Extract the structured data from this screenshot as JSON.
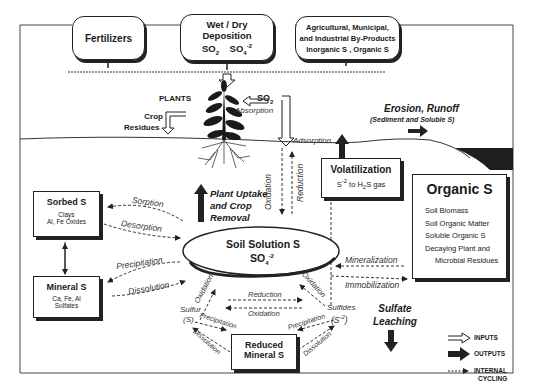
{
  "inputs": {
    "fertilizers": "Fertilizers",
    "deposition": {
      "title": "Wet / Dry Deposition",
      "species_1": "SO",
      "species_1_sub": "2",
      "species_2": "SO",
      "species_2_sub": "4",
      "species_2_sup": "-2"
    },
    "byproducts": {
      "line_1": "Agricultural, Municipal,",
      "line_2": "and Industrial By-Products",
      "line_3": "Inorganic S ,  Organic S"
    }
  },
  "plants": {
    "label": "PLANTS",
    "crop_residues_1": "Crop",
    "crop_residues_2": "Residues",
    "so2": "SO",
    "so2_sub": "2",
    "absorption": "Absorption",
    "adsorption": "Adsorption"
  },
  "erosion": {
    "title": "Erosion, Runoff",
    "subtitle": "(Sediment and Soluble S)"
  },
  "volatilization": {
    "title": "Volatilization",
    "detail_pre": "S",
    "detail_sup": "-2",
    "detail_mid": " to H",
    "detail_sub": "2",
    "detail_post": "S gas"
  },
  "organic_s": {
    "title": "Organic S",
    "items": [
      "Soil Biomass",
      "Soil Organic Matter",
      "Soluble Organic S",
      "Decaying Plant and",
      "Microbial Residues"
    ]
  },
  "sorbed_s": {
    "title": "Sorbed S",
    "line_1": "Clays",
    "line_2": "Al, Fe Oxides"
  },
  "mineral_s": {
    "title": "Mineral S",
    "line_1": "Ca, Fe, Al",
    "line_2": "Sulfates"
  },
  "soil_solution": {
    "title": "Soil Solution S",
    "formula": "SO",
    "formula_sub": "4",
    "formula_sup": "-2"
  },
  "reduced_mineral_s": {
    "line_1": "Reduced",
    "line_2": "Mineral S"
  },
  "plant_uptake": {
    "line_1": "Plant Uptake",
    "line_2": "and Crop",
    "line_3": "Removal"
  },
  "sulfate_leaching": {
    "line_1": "Sulfate",
    "line_2": "Leaching"
  },
  "sulfur": {
    "line_1": "Sulfur",
    "line_2": "(S)"
  },
  "sulfides": {
    "line_1": "Sulfides",
    "formula": "(S",
    "formula_sup": "-2",
    "formula_end": ")"
  },
  "process_labels": {
    "sorption": "Sorption",
    "desorption": "Desorption",
    "precipitation": "Precipitation",
    "dissolution": "Dissolution",
    "oxidation": "Oxidation",
    "reduction": "Reduction",
    "mineralization": "Mineralization",
    "immobilization": "Immobilization"
  },
  "legend": {
    "inputs": "INPUTS",
    "outputs": "OUTPUTS",
    "internal_1": "INTERNAL",
    "internal_2": "CYCLING"
  },
  "colors": {
    "ink": "#222222",
    "background": "#ffffff",
    "soil_dark": "#1e1e1e"
  }
}
